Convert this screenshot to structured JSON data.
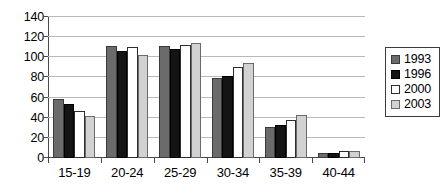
{
  "chart_data": {
    "type": "bar",
    "title": "",
    "subtitle": "",
    "xlabel": "",
    "ylabel": "",
    "ylim": [
      0,
      140
    ],
    "yticks": [
      0,
      20,
      40,
      60,
      80,
      100,
      120,
      140
    ],
    "grid": "horizontal",
    "legend_position": "right",
    "categories": [
      "15-19",
      "20-24",
      "25-29",
      "30-34",
      "35-39",
      "40-44"
    ],
    "series": [
      {
        "name": "1993",
        "color": "#6b6b6b",
        "values": [
          59,
          111,
          111,
          79,
          31,
          5
        ]
      },
      {
        "name": "1996",
        "color": "#141414",
        "values": [
          54,
          106,
          108,
          81,
          33,
          5
        ]
      },
      {
        "name": "2000",
        "color": "#ffffff",
        "values": [
          47,
          110,
          112,
          90,
          38,
          7
        ]
      },
      {
        "name": "2003",
        "color": "#d2d2d2",
        "values": [
          42,
          102,
          114,
          94,
          43,
          7
        ]
      }
    ]
  },
  "legend": {
    "entries": [
      {
        "label": "1993"
      },
      {
        "label": "1996"
      },
      {
        "label": "2000"
      },
      {
        "label": "2003"
      }
    ]
  }
}
